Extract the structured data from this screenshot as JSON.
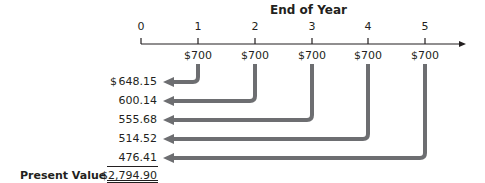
{
  "diagram": {
    "title": "End of Year",
    "timeline": {
      "years": [
        "0",
        "1",
        "2",
        "3",
        "4",
        "5"
      ],
      "cash_flows": [
        "$700",
        "$700",
        "$700",
        "$700",
        "$700"
      ]
    },
    "present_values": {
      "currency_symbol": "$",
      "values": [
        "648.15",
        "600.14",
        "555.68",
        "514.52",
        "476.41"
      ]
    },
    "total": {
      "label": "Present Value",
      "value": "$2,794.90"
    },
    "colors": {
      "arrow": "#6d6e71",
      "text": "#231f20"
    }
  }
}
